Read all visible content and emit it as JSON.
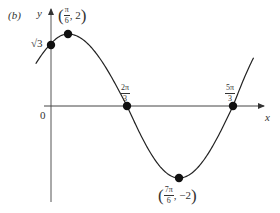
{
  "figure": {
    "part_label": "(b)",
    "axes": {
      "x_label": "x",
      "y_label": "y",
      "origin_label": "0"
    },
    "y_intercept_label": "√3",
    "points": [
      {
        "name": "maximum",
        "x_num": "π",
        "x_den": "6",
        "y": "2",
        "px": 68,
        "py": 34
      },
      {
        "name": "y-intercept",
        "label": "√3",
        "px": 51,
        "py": 45
      },
      {
        "name": "zero-1",
        "num": "2π",
        "den": "3",
        "px": 127,
        "py": 106
      },
      {
        "name": "minimum",
        "x_num": "7π",
        "x_den": "6",
        "y": "−2",
        "px": 179,
        "py": 178
      },
      {
        "name": "zero-2",
        "num": "5π",
        "den": "3",
        "px": 233,
        "py": 106
      }
    ],
    "curve_color": "#222222",
    "point_color": "#111111"
  },
  "chart_data": {
    "type": "line",
    "xlabel": "x",
    "ylabel": "y",
    "key_points": [
      {
        "x": "0",
        "y": "√3"
      },
      {
        "x": "π/6",
        "y": "2"
      },
      {
        "x": "2π/3",
        "y": "0"
      },
      {
        "x": "7π/6",
        "y": "-2"
      },
      {
        "x": "5π/3",
        "y": "0"
      }
    ],
    "grid": false
  }
}
